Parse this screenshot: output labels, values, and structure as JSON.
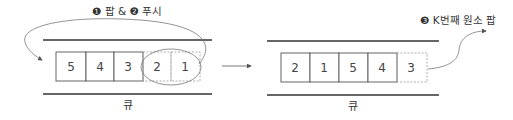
{
  "left_panel": {
    "step_label": "❶ 팝 & ❷ 푸시",
    "queue_label": "큐",
    "cells": [
      {
        "value": "5",
        "style": "solid"
      },
      {
        "value": "4",
        "style": "solid"
      },
      {
        "value": "3",
        "style": "solid"
      },
      {
        "value": "2",
        "style": "dashed"
      },
      {
        "value": "1",
        "style": "dashed"
      }
    ],
    "highlighted_cells": [
      "2",
      "1"
    ]
  },
  "right_panel": {
    "step_label": "❸ K번째 원소 팝",
    "queue_label": "큐",
    "cells": [
      {
        "value": "2",
        "style": "solid"
      },
      {
        "value": "1",
        "style": "solid"
      },
      {
        "value": "5",
        "style": "solid"
      },
      {
        "value": "4",
        "style": "solid"
      },
      {
        "value": "3",
        "style": "dashed"
      }
    ]
  },
  "colors": {
    "line": "#333333",
    "box_border": "#555555",
    "dashed": "#9a9a9a",
    "arrow": "#777777",
    "text": "#444444"
  }
}
